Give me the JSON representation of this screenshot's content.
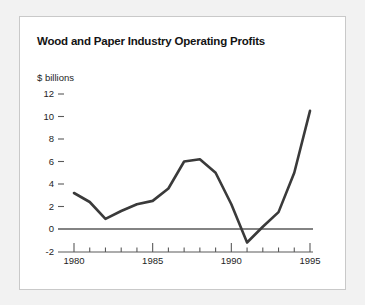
{
  "figure": {
    "title": "Wood and Paper Industry Operating Profits",
    "background_color": "#f2f2f2",
    "panel_color": "#ffffff",
    "border_color": "#c9c9c9"
  },
  "chart_data": {
    "type": "line",
    "title": "Wood and Paper Industry Operating Profits",
    "xlabel": "",
    "ylabel": "$ billions",
    "x": [
      1980,
      1981,
      1982,
      1983,
      1984,
      1985,
      1986,
      1987,
      1988,
      1989,
      1990,
      1991,
      1992,
      1993,
      1994,
      1995
    ],
    "values": [
      3.2,
      2.4,
      0.9,
      1.6,
      2.2,
      2.5,
      3.6,
      6.0,
      6.2,
      5.0,
      2.2,
      -1.2,
      0.2,
      1.5,
      5.0,
      10.5
    ],
    "series": [
      {
        "name": "Operating Profits",
        "color": "#3a3a3a",
        "values": [
          3.2,
          2.4,
          0.9,
          1.6,
          2.2,
          2.5,
          3.6,
          6.0,
          6.2,
          5.0,
          2.2,
          -1.2,
          0.2,
          1.5,
          5.0,
          10.5
        ]
      }
    ],
    "xlim": [
      1979,
      1996
    ],
    "ylim": [
      -2,
      12
    ],
    "ytick_values": [
      12,
      10,
      8,
      6,
      4,
      2,
      0,
      -2
    ],
    "ytick_labels": [
      "12",
      "10",
      "8",
      "6",
      "4",
      "2",
      "0",
      "-2"
    ],
    "xtick_values": [
      1980,
      1981,
      1982,
      1983,
      1984,
      1985,
      1986,
      1987,
      1988,
      1989,
      1990,
      1991,
      1992,
      1993,
      1994,
      1995
    ],
    "xtick_major_values": [
      1980,
      1985,
      1990,
      1995
    ],
    "xtick_major_labels": [
      "1980",
      "1985",
      "1990",
      "1995"
    ],
    "grid": false,
    "legend": false,
    "zero_line": true,
    "line_color": "#3a3a3a",
    "axis_color": "#5a5a5a"
  }
}
